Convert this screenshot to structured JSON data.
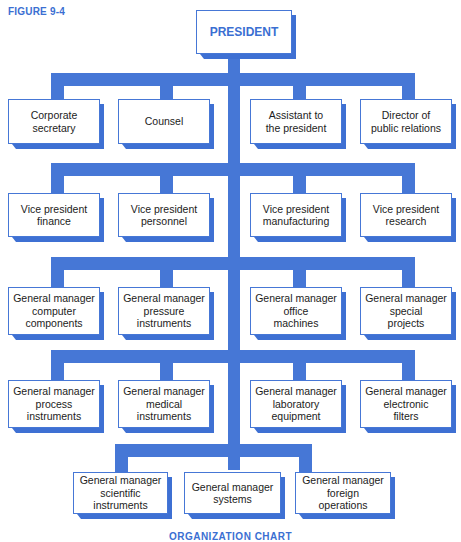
{
  "figure_label": "FIGURE 9-4",
  "caption": "ORGANIZATION CHART",
  "colors": {
    "accent": "#4677d6",
    "box_face": "#ffffff",
    "text": "#1c1c1c"
  },
  "president": {
    "label": "PRESIDENT"
  },
  "row1": [
    {
      "label": "Corporate\nsecretary"
    },
    {
      "label": "Counsel"
    },
    {
      "label": "Assistant to\nthe president"
    },
    {
      "label": "Director of\npublic relations"
    }
  ],
  "row2": [
    {
      "label": "Vice president\nfinance"
    },
    {
      "label": "Vice president\npersonnel"
    },
    {
      "label": "Vice president\nmanufacturing"
    },
    {
      "label": "Vice president\nresearch"
    }
  ],
  "row3": [
    {
      "label": "General manager\ncomputer\ncomponents"
    },
    {
      "label": "General manager\npressure\ninstruments"
    },
    {
      "label": "General manager\noffice\nmachines"
    },
    {
      "label": "General manager\nspecial\nprojects"
    }
  ],
  "row4": [
    {
      "label": "General manager\nprocess\ninstruments"
    },
    {
      "label": "General manager\nmedical\ninstruments"
    },
    {
      "label": "General manager\nlaboratory\nequipment"
    },
    {
      "label": "General manager\nelectronic\nfilters"
    }
  ],
  "row5": [
    {
      "label": "General manager\nscientific\ninstruments"
    },
    {
      "label": "General manager\nsystems"
    },
    {
      "label": "General manager\nforeign\noperations"
    }
  ]
}
